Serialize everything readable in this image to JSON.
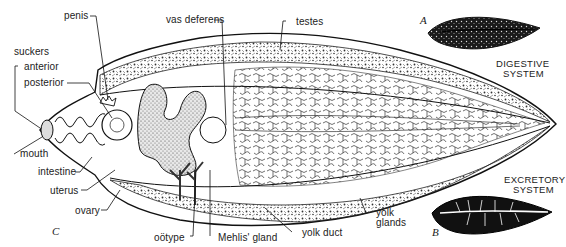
{
  "figure": {
    "panel_c_label": "C",
    "panel_a_label": "A",
    "panel_b_label": "B",
    "labels": {
      "penis": "penis",
      "vas_deferens": "vas deferens",
      "testes": "testes",
      "suckers": "suckers",
      "anterior": "anterior",
      "posterior": "posterior",
      "mouth": "mouth",
      "intestine": "intestine",
      "uterus": "uterus",
      "ovary": "ovary",
      "ootype": "oötype",
      "mehlis_gland": "Mehlis' gland",
      "yolk_duct": "yolk duct",
      "yolk_glands_line1": "yolk",
      "yolk_glands_line2": "glands"
    },
    "insets": {
      "digestive_line1": "DIGESTIVE",
      "digestive_line2": "SYSTEM",
      "excretory_line1": "EXCRETORY",
      "excretory_line2": "SYSTEM"
    }
  }
}
